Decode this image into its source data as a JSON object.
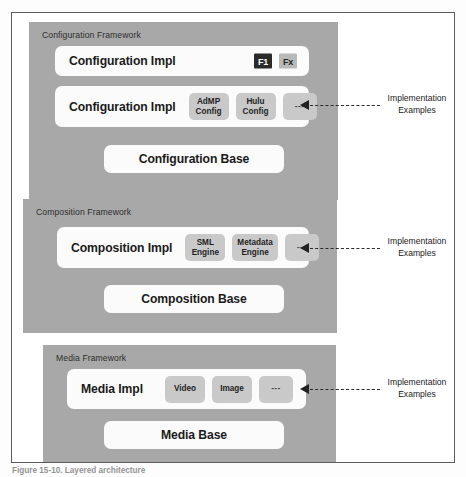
{
  "figure": {
    "caption": "Figure 15-10. Layered architecture",
    "colors": {
      "panel_gray": "#a8a8a8",
      "bar_white": "#fbfbfb",
      "chip_gray": "#c9c9c9",
      "badge_dark": "#2b2b2b",
      "badge_light": "#b9b9b9",
      "frame_border": "#5a5a5a",
      "text_dark": "#1a1a1a"
    }
  },
  "frameworks": [
    {
      "id": "configuration",
      "title": "Configuration Framework",
      "interface_bar": {
        "label": "Configuration Impl",
        "badges": [
          {
            "text": "F1",
            "style": "dark"
          },
          {
            "text": "Fx",
            "style": "light"
          }
        ]
      },
      "impl_bar": {
        "label": "Configuration Impl",
        "chips": [
          {
            "line1": "AdMP",
            "line2": "Config"
          },
          {
            "line1": "Hulu",
            "line2": "Config"
          },
          {
            "line1": "---",
            "line2": ""
          }
        ]
      },
      "base_bar": {
        "label": "Configuration Base"
      },
      "callout": {
        "text_line1": "Implementation",
        "text_line2": "Examples"
      }
    },
    {
      "id": "composition",
      "title": "Composition Framework",
      "impl_bar": {
        "label": "Composition Impl",
        "chips": [
          {
            "line1": "SML",
            "line2": "Engine"
          },
          {
            "line1": "Metadata",
            "line2": "Engine"
          },
          {
            "line1": "---",
            "line2": ""
          }
        ]
      },
      "base_bar": {
        "label": "Composition Base"
      },
      "callout": {
        "text_line1": "Implementation",
        "text_line2": "Examples"
      }
    },
    {
      "id": "media",
      "title": "Media Framework",
      "impl_bar": {
        "label": "Media Impl",
        "chips": [
          {
            "line1": "Video",
            "line2": ""
          },
          {
            "line1": "Image",
            "line2": ""
          },
          {
            "line1": "---",
            "line2": ""
          }
        ]
      },
      "base_bar": {
        "label": "Media Base"
      },
      "callout": {
        "text_line1": "Implementation",
        "text_line2": "Examples"
      }
    }
  ]
}
